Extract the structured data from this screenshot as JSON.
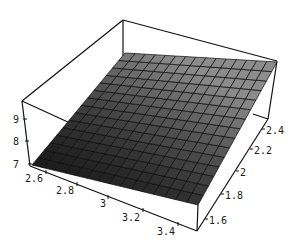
{
  "chart_data": {
    "type": "surface3d",
    "title": "",
    "xlabel": "",
    "ylabel": "",
    "zlabel": "",
    "x_ticks": [
      "2.6",
      "2.8",
      "3",
      "3.2",
      "3.4"
    ],
    "y_ticks": [
      "1.6",
      "1.8",
      "2",
      "2.2",
      "2.4"
    ],
    "z_ticks": [
      "7",
      "8",
      "9"
    ],
    "x_range": [
      2.55,
      3.45
    ],
    "y_range": [
      1.55,
      2.45
    ],
    "z_range": [
      7,
      10
    ],
    "grid_cells": [
      15,
      15
    ],
    "surface_corners": {
      "x_min_y_min": 7.0,
      "x_max_y_min": 8.4,
      "x_min_y_max": 9.3,
      "x_max_y_max": 9.7
    },
    "box": true,
    "shading": "gray, darker toward low z"
  },
  "colors": {
    "box_line": "#111111",
    "surface_dark": "#1c1c1c",
    "surface_light": "#8a8a8a",
    "grid_line": "#0a0a0a"
  }
}
